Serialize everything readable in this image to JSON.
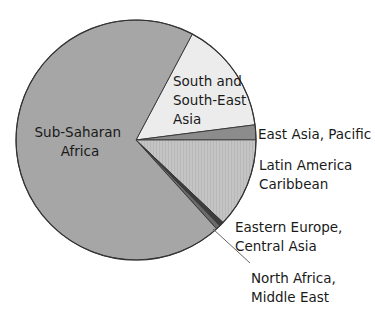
{
  "chart_data": {
    "type": "pie",
    "title": "",
    "unit": "percent (estimated from slice angles)",
    "start_angle_deg": -62,
    "direction": "clockwise",
    "slices": [
      {
        "label": "South and South-East Asia",
        "value": 15.2,
        "color": "#ececec",
        "label_lines": [
          "South and",
          "South-East",
          "Asia"
        ],
        "label_pos": "inside"
      },
      {
        "label": "East Asia, Pacific",
        "value": 2.0,
        "color": "#8c8c8c",
        "label_lines": [
          "East Asia, Pacific"
        ],
        "label_pos": "outside"
      },
      {
        "label": "Latin America Caribbean",
        "value": 12.1,
        "color": "#c4c4c4",
        "pattern": "vertical-streaks",
        "label_lines": [
          "Latin America",
          "Caribbean"
        ],
        "label_pos": "outside"
      },
      {
        "label": "Eastern Europe, Central Asia",
        "value": 0.6,
        "color": "#3c3c3c",
        "label_lines": [
          "Eastern Europe,",
          "Central Asia"
        ],
        "label_pos": "outside"
      },
      {
        "label": "North Africa, Middle East",
        "value": 0.6,
        "color": "#6a6a6a",
        "label_lines": [
          "North Africa,",
          "Middle East"
        ],
        "label_pos": "outside-leader"
      },
      {
        "label": "Sub-Saharan Africa",
        "value": 69.5,
        "color": "#a6a6a6",
        "label_lines": [
          "Sub-Saharan",
          "Africa"
        ],
        "label_pos": "inside"
      }
    ],
    "legend": "none (direct labels)",
    "grid": false
  },
  "labels": {
    "sub_saharan_1": "Sub-Saharan",
    "sub_saharan_2": "Africa",
    "south_asia_1": "South and",
    "south_asia_2": "South-East",
    "south_asia_3": "Asia",
    "east_asia": "East Asia, Pacific",
    "latin_1": "Latin America",
    "latin_2": "Caribbean",
    "eastern_europe_1": "Eastern Europe,",
    "eastern_europe_2": "Central Asia",
    "north_africa_1": "North Africa,",
    "north_africa_2": "Middle East"
  }
}
